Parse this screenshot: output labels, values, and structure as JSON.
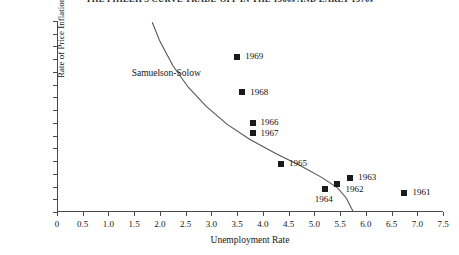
{
  "chart_data": {
    "type": "scatter",
    "title": "THE PHILLIPS CURVE TRADE-OFF IN THE 1960s AND EARLY 1970s",
    "xlabel": "Unemployment Rate",
    "ylabel": "Rate of Price Inflation",
    "xlim": [
      0,
      7.5
    ],
    "ylim": [
      0,
      7.5
    ],
    "xticks": [
      "0",
      "0.5",
      "1.0",
      "1.5",
      "2.0",
      "2.5",
      "3.0",
      "3.5",
      "4.0",
      "4.5",
      "5.0",
      "5.5",
      "6.0",
      "6.5",
      "7.0",
      "7.5"
    ],
    "xtick_values": [
      0,
      0.5,
      1.0,
      1.5,
      2.0,
      2.5,
      3.0,
      3.5,
      4.0,
      4.5,
      5.0,
      5.5,
      6.0,
      6.5,
      7.0,
      7.5
    ],
    "yticks": [
      "0",
      ".5",
      "1.0",
      "1.5",
      "2.0",
      "2.5",
      "3.0",
      "3.5",
      "4.0",
      "4.5",
      "5.0",
      "5.5",
      "6.0",
      "6.5",
      "7.0",
      "7.5"
    ],
    "ytick_values": [
      0,
      0.5,
      1.0,
      1.5,
      2.0,
      2.5,
      3.0,
      3.5,
      4.0,
      4.5,
      5.0,
      5.5,
      6.0,
      6.5,
      7.0,
      7.5
    ],
    "grid": false,
    "legend": null,
    "points": [
      {
        "label": "1969",
        "x": 3.5,
        "y": 6.1,
        "label_side": "right"
      },
      {
        "label": "1968",
        "x": 3.6,
        "y": 4.7,
        "label_side": "right"
      },
      {
        "label": "1966",
        "x": 3.8,
        "y": 3.5,
        "label_side": "right"
      },
      {
        "label": "1967",
        "x": 3.8,
        "y": 3.1,
        "label_side": "right"
      },
      {
        "label": "1965",
        "x": 4.35,
        "y": 1.9,
        "label_side": "right"
      },
      {
        "label": "1963",
        "x": 5.7,
        "y": 1.35,
        "label_side": "right"
      },
      {
        "label": "1962",
        "x": 5.45,
        "y": 1.1,
        "label_side": "right-low"
      },
      {
        "label": "1964",
        "x": 5.2,
        "y": 0.9,
        "label_side": "below"
      },
      {
        "label": "1961",
        "x": 6.75,
        "y": 0.75,
        "label_side": "right"
      }
    ],
    "annotations": [
      {
        "text": "Samuelson-Solow",
        "x": 1.45,
        "y": 5.45
      }
    ],
    "curve": {
      "name": "Samuelson-Solow Phillips curve",
      "points": [
        {
          "x": 1.85,
          "y": 7.45
        },
        {
          "x": 2.0,
          "y": 6.7
        },
        {
          "x": 2.25,
          "y": 5.75
        },
        {
          "x": 2.55,
          "y": 4.9
        },
        {
          "x": 2.9,
          "y": 4.15
        },
        {
          "x": 3.3,
          "y": 3.45
        },
        {
          "x": 3.75,
          "y": 2.85
        },
        {
          "x": 4.25,
          "y": 2.3
        },
        {
          "x": 4.75,
          "y": 1.8
        },
        {
          "x": 5.15,
          "y": 1.35
        },
        {
          "x": 5.45,
          "y": 0.95
        },
        {
          "x": 5.62,
          "y": 0.55
        },
        {
          "x": 5.72,
          "y": 0.15
        },
        {
          "x": 5.76,
          "y": 0.0
        }
      ]
    },
    "colors": {
      "marker": "#1a1a1a",
      "axis": "#4a4a4a",
      "curve": "#555555",
      "text": "#161616",
      "background": "#ffffff"
    }
  }
}
